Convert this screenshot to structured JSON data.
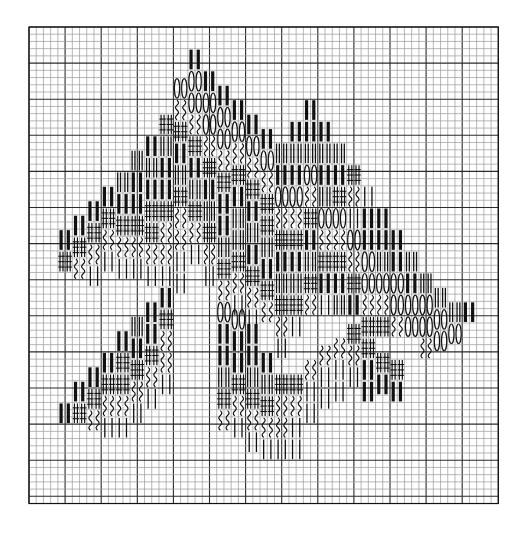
{
  "chart": {
    "title": "",
    "kind": "needlework stitch chart",
    "grid": {
      "x": 29,
      "y": 27,
      "cols": 65,
      "rows": 66,
      "cell": 7.22,
      "major_every": 5,
      "minor_color": "#9a9a9a",
      "major_color": "#2a2a2a",
      "border_color": "#111111"
    },
    "ink": "#111111",
    "legend": {
      "B": "solid double bar",
      "D": "outlined double bar",
      "H": "hash cross stitch",
      "W": "wavy stitch",
      "L": "thin straight stitch",
      "O": "oval stitch"
    },
    "stacks": [
      {
        "c": 4,
        "r": 28,
        "s": "BH"
      },
      {
        "c": 6,
        "r": 26,
        "s": "BHW"
      },
      {
        "c": 8,
        "r": 24,
        "s": "BHWL"
      },
      {
        "c": 10,
        "r": 22,
        "s": "BHWL"
      },
      {
        "c": 12,
        "r": 20,
        "s": "DBHWL"
      },
      {
        "c": 14,
        "r": 17,
        "s": "DBBHWL"
      },
      {
        "c": 16,
        "r": 15,
        "s": "BDBHHWL"
      },
      {
        "c": 18,
        "r": 12,
        "s": "HDBBHWWL"
      },
      {
        "c": 20,
        "r": 7,
        "s": "OWHBDHWWLL"
      },
      {
        "c": 22,
        "r": 3,
        "s": "BOOWHBDHWL"
      },
      {
        "c": 24,
        "r": 6,
        "s": "BOOWHBDHWL"
      },
      {
        "c": 26,
        "r": 8,
        "s": "BOOWHBBDHW"
      },
      {
        "c": 28,
        "r": 10,
        "s": "BOWHBDDHWL"
      },
      {
        "c": 30,
        "r": 12,
        "s": "BOWHBDBHWL"
      },
      {
        "c": 32,
        "r": 14,
        "s": "BOWHHDBHW"
      },
      {
        "c": 34,
        "r": 16,
        "s": "DBOWHBDHWL"
      },
      {
        "c": 36,
        "r": 13,
        "s": "BDBOWHBDHL"
      },
      {
        "c": 38,
        "r": 10,
        "s": "BBDOWHBDHW"
      },
      {
        "c": 40,
        "r": 13,
        "s": "BDBDOWHBL"
      },
      {
        "c": 42,
        "r": 16,
        "s": "DBHOWHBD"
      },
      {
        "c": 44,
        "r": 19,
        "s": "HWLOWHB"
      },
      {
        "c": 46,
        "r": 22,
        "s": "LBBOOWH"
      },
      {
        "c": 48,
        "r": 25,
        "s": "BBDOWH"
      },
      {
        "c": 50,
        "r": 28,
        "s": "BBOOW"
      },
      {
        "c": 52,
        "r": 31,
        "s": "DBOO"
      },
      {
        "c": 54,
        "r": 34,
        "s": "DOOW"
      },
      {
        "c": 56,
        "r": 36,
        "s": "DOO"
      },
      {
        "c": 58,
        "r": 38,
        "s": "DO"
      },
      {
        "c": 60,
        "r": 38,
        "s": "B"
      },
      {
        "c": 4,
        "r": 52,
        "s": "B"
      },
      {
        "c": 6,
        "r": 49,
        "s": "BH"
      },
      {
        "c": 8,
        "r": 47,
        "s": "BHW"
      },
      {
        "c": 10,
        "r": 45,
        "s": "BHWL"
      },
      {
        "c": 12,
        "r": 42,
        "s": "BHHWL"
      },
      {
        "c": 14,
        "r": 40,
        "s": "DBHWL"
      },
      {
        "c": 16,
        "r": 38,
        "s": "BBHWL"
      },
      {
        "c": 18,
        "r": 36,
        "s": "BHWWL"
      },
      {
        "c": 26,
        "r": 38,
        "s": "OBBDHW"
      },
      {
        "c": 28,
        "r": 39,
        "s": "OBBHWL"
      },
      {
        "c": 30,
        "r": 41,
        "s": "BBDHWL"
      },
      {
        "c": 32,
        "r": 45,
        "s": "BDHWL"
      },
      {
        "c": 34,
        "r": 48,
        "s": "HWWL"
      },
      {
        "c": 36,
        "r": 48,
        "s": "HWLL"
      },
      {
        "c": 38,
        "r": 46,
        "s": "WLL"
      },
      {
        "c": 40,
        "r": 44,
        "s": "WLL"
      },
      {
        "c": 42,
        "r": 43,
        "s": "WLL"
      },
      {
        "c": 44,
        "r": 41,
        "s": "HWL"
      },
      {
        "c": 46,
        "r": 43,
        "s": "HBB"
      },
      {
        "c": 48,
        "r": 45,
        "s": "HB"
      },
      {
        "c": 50,
        "r": 46,
        "s": "HB"
      }
    ]
  }
}
